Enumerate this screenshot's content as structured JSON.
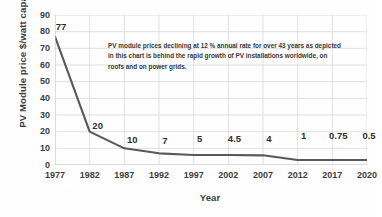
{
  "chart_data": {
    "type": "line",
    "title": "",
    "xlabel": "Year",
    "ylabel": "PV Module price $/watt capacity",
    "x": [
      1977,
      1982,
      1987,
      1992,
      1997,
      2002,
      2007,
      2012,
      2017,
      2020
    ],
    "categories": [
      "1977",
      "1982",
      "1987",
      "1992",
      "1997",
      "2002",
      "2007",
      "2012",
      "2017",
      "2020"
    ],
    "values": [
      77,
      20,
      10,
      7,
      5,
      4.5,
      4,
      1,
      0.75,
      0.5
    ],
    "point_labels": [
      "77",
      "20",
      "10",
      "7",
      "5",
      "4.5",
      "4",
      "1",
      "0.75",
      "0.5"
    ],
    "plotted_values": [
      77,
      20,
      10,
      7,
      6,
      6,
      5.8,
      3,
      3,
      3
    ],
    "ylim": [
      0,
      90
    ],
    "yticks": [
      0,
      10,
      20,
      30,
      40,
      50,
      60,
      70,
      80,
      90
    ],
    "ytick_labels": [
      "0",
      "10",
      "20",
      "30",
      "40",
      "50",
      "60",
      "70",
      "80",
      "90"
    ],
    "grid": true,
    "legend": false,
    "series_color": "#595959",
    "grid_color": "#dcdcdc",
    "annotation": {
      "lines": [
        "PV module prices declining at 12 % annual rate for over 43 years as depicted",
        "in this chart is behind the rapid growth of PV installations worldwide, on",
        "roofs and on power grids."
      ]
    }
  }
}
